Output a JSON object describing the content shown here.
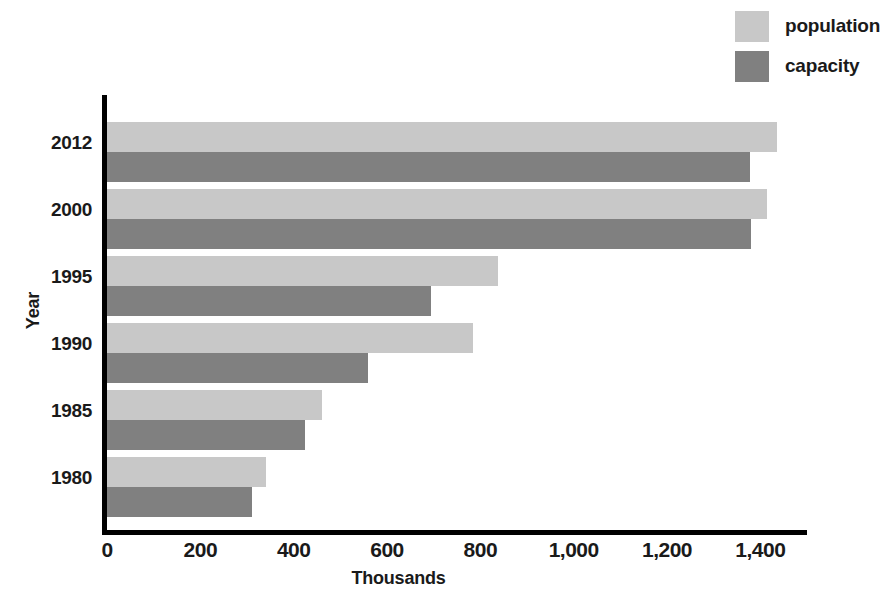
{
  "chart_data": {
    "type": "bar",
    "orientation": "horizontal",
    "title": "",
    "xlabel": "Thousands",
    "ylabel": "Year",
    "categories": [
      "2012",
      "2000",
      "1995",
      "1990",
      "1985",
      "1980"
    ],
    "series": [
      {
        "name": "population",
        "color": "#c8c8c8",
        "values": [
          1435,
          1415,
          838,
          785,
          460,
          340
        ]
      },
      {
        "name": "capacity",
        "color": "#808080",
        "values": [
          1378,
          1380,
          695,
          560,
          425,
          310
        ]
      }
    ],
    "xlim": [
      0,
      1500
    ],
    "x_ticks": [
      0,
      200,
      400,
      600,
      800,
      1000,
      1200,
      1400
    ],
    "x_tick_labels": [
      "0",
      "200",
      "400",
      "600",
      "800",
      "1,000",
      "1,200",
      "1,400"
    ],
    "grid": false,
    "legend_position": "top-right",
    "axis_color": "#000000"
  },
  "legend": {
    "items": [
      {
        "label": "population",
        "color": "#c8c8c8"
      },
      {
        "label": "capacity",
        "color": "#808080"
      }
    ]
  },
  "axes": {
    "x_title": "Thousands",
    "y_title": "Year"
  }
}
